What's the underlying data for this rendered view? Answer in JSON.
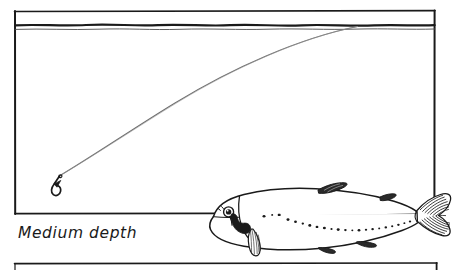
{
  "figure": {
    "kind": "hand-drawn-illustration",
    "caption": "Medium depth",
    "background_color": "#ffffff",
    "ink_color": "#1a1a1a",
    "line_color": "#555555"
  },
  "panels": {
    "main": {
      "name": "water-column-panel",
      "x": 14,
      "y": 11,
      "width": 421,
      "height": 203
    },
    "next": {
      "name": "next-panel-top-edge",
      "x": 14,
      "y": 263,
      "width": 423,
      "height": 7
    }
  },
  "water": {
    "surface_label": "water-surface-line",
    "surface_y": 25,
    "secondary_y": 29,
    "air_band_top": 11,
    "air_band_bottom": 24
  },
  "fishing_line": {
    "label": "fishing-line",
    "entry_point": {
      "x": 357,
      "y": 26
    },
    "hook_point": {
      "x": 57,
      "y": 177
    },
    "stroke_color": "#6a6a6a"
  },
  "hook": {
    "label": "fishing-hook",
    "x": 57,
    "y": 178
  },
  "fish": {
    "label": "trout",
    "nose_x": 208,
    "tail_x": 452,
    "center_y": 222,
    "spot_count": 22,
    "fins": [
      "dorsal-fin",
      "adipose-fin",
      "pectoral-fin",
      "pelvic-fin",
      "anal-fin",
      "caudal-fin"
    ]
  },
  "caption": {
    "text": "Medium depth",
    "x": 18,
    "y": 237
  }
}
